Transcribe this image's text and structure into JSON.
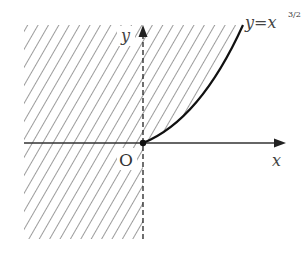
{
  "diagram": {
    "curve_label": "y=x",
    "curve_exponent": "3/2",
    "axis_x_label": "x",
    "axis_y_label": "y",
    "origin_label": "O",
    "colors": {
      "hatch": "#555555",
      "axis": "#333333",
      "curve": "#111111",
      "background": "#ffffff"
    }
  }
}
